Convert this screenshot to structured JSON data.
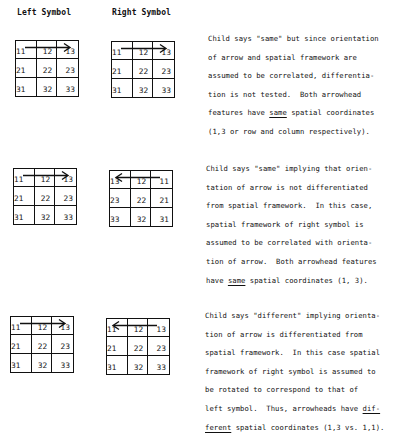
{
  "headers": {
    "left": "Left Symbol",
    "right": "Right Symbol"
  },
  "rows": [
    {
      "left_grid": {
        "cells": [
          "11",
          "12",
          "13",
          "21",
          "22",
          "23",
          "31",
          "32",
          "33"
        ],
        "arrow_direction": "right",
        "arrow_icon": "arrow-right-icon"
      },
      "right_grid": {
        "cells": [
          "11",
          "12",
          "13",
          "21",
          "22",
          "23",
          "31",
          "32",
          "33"
        ],
        "arrow_direction": "right",
        "arrow_icon": "arrow-right-icon"
      },
      "explanation": {
        "lines": [
          [
            "Child says \"same\" but since orientation"
          ],
          [
            "of arrow and spatial framework are"
          ],
          [
            "assumed to be correlated, differentia-"
          ],
          [
            "tion is not tested.  Both arrowhead"
          ],
          [
            "features have ",
            {
              "u": "same"
            },
            " spatial coordinates"
          ],
          [
            "(1,3 or row and column respectively)."
          ]
        ]
      }
    },
    {
      "left_grid": {
        "cells": [
          "11",
          "12",
          "13",
          "21",
          "22",
          "23",
          "31",
          "32",
          "33"
        ],
        "arrow_direction": "right",
        "arrow_icon": "arrow-right-icon"
      },
      "right_grid": {
        "cells": [
          "13",
          "12",
          "11",
          "23",
          "22",
          "21",
          "33",
          "32",
          "31"
        ],
        "arrow_direction": "left",
        "arrow_icon": "arrow-left-icon"
      },
      "explanation": {
        "lines": [
          [
            "Child says \"same\" implying that orien-"
          ],
          [
            "tation of arrow is not differentiated"
          ],
          [
            "from spatial framework.  In this case,"
          ],
          [
            "spatial framework of right symbol is"
          ],
          [
            "assumed to be correlated with orienta-"
          ],
          [
            "tion of arrow.  Both arrowhead features"
          ],
          [
            "have ",
            {
              "u": "same"
            },
            " spatial coordinates (1, 3)."
          ]
        ]
      }
    },
    {
      "left_grid": {
        "cells": [
          "11",
          "12",
          "13",
          "21",
          "22",
          "23",
          "31",
          "32",
          "33"
        ],
        "arrow_direction": "right",
        "arrow_icon": "arrow-right-icon"
      },
      "right_grid": {
        "cells": [
          "11",
          "12",
          "13",
          "21",
          "22",
          "23",
          "31",
          "32",
          "33"
        ],
        "arrow_direction": "left",
        "arrow_icon": "arrow-left-icon"
      },
      "explanation": {
        "lines": [
          [
            "Child says \"different\" implying orienta-"
          ],
          [
            "tion of arrow is differentiated from"
          ],
          [
            "spatial framework.  In this case spatial"
          ],
          [
            "framework of right symbol is assumed to"
          ],
          [
            "be rotated to correspond to that of"
          ],
          [
            "left symbol.  Thus, arrowheads have ",
            {
              "u": "dif-"
            }
          ],
          [
            {
              "u": "ferent"
            },
            " spatial coordinates (1,3 vs. 1,1)."
          ]
        ]
      }
    }
  ]
}
